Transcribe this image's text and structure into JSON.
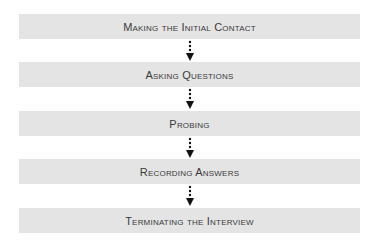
{
  "diagram": {
    "type": "flowchart",
    "direction": "top-to-bottom",
    "steps": [
      {
        "label": "Making the Initial Contact"
      },
      {
        "label": "Asking Questions"
      },
      {
        "label": "Probing"
      },
      {
        "label": "Recording Answers"
      },
      {
        "label": "Terminating the Interview"
      }
    ],
    "colors": {
      "box_fill": "#e4e4e4",
      "text": "#3a3a3a",
      "arrow": "#111111"
    }
  }
}
